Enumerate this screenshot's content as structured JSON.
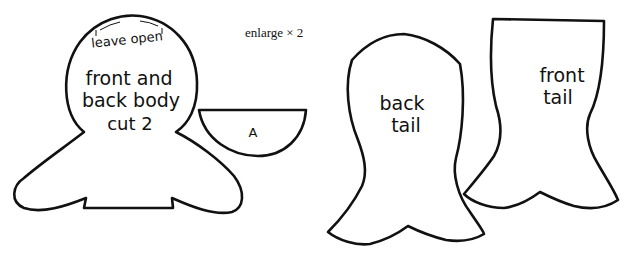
{
  "note": "enlarge × 2",
  "pieces": {
    "body": {
      "top_note": "leave open",
      "line1": "front and",
      "line2": "back body",
      "line3": "cut 2"
    },
    "a": {
      "label": "A"
    },
    "back_tail": {
      "line1": "back",
      "line2": "tail"
    },
    "front_tail": {
      "line1": "front",
      "line2": "tail"
    }
  },
  "colors": {
    "stroke": "#111111",
    "background": "#ffffff"
  }
}
